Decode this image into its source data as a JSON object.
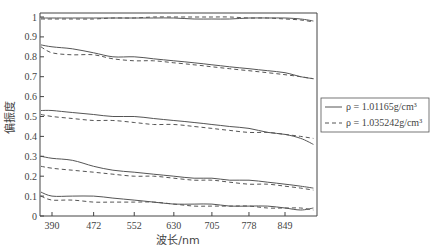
{
  "chart_data": {
    "type": "line",
    "title": "",
    "xlabel": "波长/nm",
    "ylabel": "偏振度",
    "x_ticks": [
      390,
      472,
      552,
      630,
      705,
      778,
      849
    ],
    "y_ticks": [
      0,
      0.1,
      0.2,
      0.3,
      0.4,
      0.5,
      0.6,
      0.7,
      0.8,
      0.9,
      1
    ],
    "y_tick_labels": [
      "0",
      "0.1",
      "0.2",
      "0.3",
      "0.4",
      "0.5",
      "0.6",
      "0.7",
      "0.8",
      "0.9",
      "1"
    ],
    "xlim": [
      360,
      910
    ],
    "ylim": [
      0,
      1.0
    ],
    "grid": false,
    "legend": {
      "position": "right",
      "entries": [
        {
          "style": "solid",
          "label": "ρ = 1.01165g/cm³"
        },
        {
          "style": "dashed",
          "label": "ρ = 1.035242g/cm³"
        }
      ]
    },
    "x": [
      365,
      390,
      430,
      472,
      510,
      552,
      590,
      630,
      670,
      705,
      740,
      778,
      815,
      849,
      880,
      905
    ],
    "series": [
      {
        "name": "ρ = 1.01165g/cm³ (group 1)",
        "style": "solid",
        "values": [
          0.995,
          0.995,
          0.995,
          0.995,
          0.995,
          0.995,
          0.995,
          0.995,
          0.99,
          0.99,
          0.99,
          0.995,
          0.995,
          0.995,
          0.99,
          0.98
        ]
      },
      {
        "name": "ρ = 1.035242g/cm³ (group 1)",
        "style": "dashed",
        "values": [
          0.99,
          0.99,
          0.99,
          0.99,
          0.995,
          0.995,
          1.0,
          1.0,
          1.0,
          1.0,
          1.0,
          0.995,
          0.995,
          0.99,
          0.985,
          0.975
        ]
      },
      {
        "name": "ρ = 1.01165g/cm³ (group 2)",
        "style": "solid",
        "values": [
          0.86,
          0.85,
          0.84,
          0.82,
          0.8,
          0.8,
          0.79,
          0.78,
          0.77,
          0.76,
          0.75,
          0.74,
          0.73,
          0.72,
          0.7,
          0.69
        ]
      },
      {
        "name": "ρ = 1.035242g/cm³ (group 2)",
        "style": "dashed",
        "values": [
          0.85,
          0.82,
          0.81,
          0.81,
          0.79,
          0.78,
          0.78,
          0.77,
          0.76,
          0.75,
          0.74,
          0.73,
          0.72,
          0.71,
          0.7,
          0.69
        ]
      },
      {
        "name": "ρ = 1.01165g/cm³ (group 3)",
        "style": "solid",
        "values": [
          0.53,
          0.53,
          0.52,
          0.51,
          0.5,
          0.5,
          0.49,
          0.48,
          0.47,
          0.46,
          0.45,
          0.44,
          0.42,
          0.41,
          0.39,
          0.36
        ]
      },
      {
        "name": "ρ = 1.035242g/cm³ (group 3)",
        "style": "dashed",
        "values": [
          0.51,
          0.5,
          0.49,
          0.48,
          0.48,
          0.47,
          0.46,
          0.46,
          0.45,
          0.44,
          0.43,
          0.42,
          0.42,
          0.41,
          0.4,
          0.39
        ]
      },
      {
        "name": "ρ = 1.01165g/cm³ (group 4)",
        "style": "solid",
        "values": [
          0.3,
          0.29,
          0.28,
          0.25,
          0.23,
          0.22,
          0.21,
          0.2,
          0.19,
          0.19,
          0.18,
          0.18,
          0.17,
          0.16,
          0.15,
          0.14
        ]
      },
      {
        "name": "ρ = 1.035242g/cm³ (group 4)",
        "style": "dashed",
        "values": [
          0.25,
          0.24,
          0.23,
          0.22,
          0.21,
          0.2,
          0.2,
          0.19,
          0.18,
          0.18,
          0.17,
          0.16,
          0.16,
          0.15,
          0.14,
          0.13
        ]
      },
      {
        "name": "ρ = 1.01165g/cm³ (group 5)",
        "style": "solid",
        "values": [
          0.12,
          0.1,
          0.1,
          0.1,
          0.09,
          0.08,
          0.07,
          0.06,
          0.06,
          0.06,
          0.05,
          0.05,
          0.05,
          0.04,
          0.03,
          0.04
        ]
      },
      {
        "name": "ρ = 1.035242g/cm³ (group 5)",
        "style": "dashed",
        "values": [
          0.1,
          0.08,
          0.08,
          0.07,
          0.07,
          0.07,
          0.07,
          0.06,
          0.05,
          0.05,
          0.05,
          0.05,
          0.04,
          0.04,
          0.04,
          0.03
        ]
      }
    ]
  },
  "axes": {
    "xlabel": "波长/nm",
    "ylabel": "偏振度"
  },
  "legend": {
    "solid_label": "ρ = 1.01165g/cm³",
    "dashed_label": "ρ = 1.035242g/cm³"
  },
  "style": {
    "line_color": "#555555",
    "axis_color": "#444444"
  }
}
